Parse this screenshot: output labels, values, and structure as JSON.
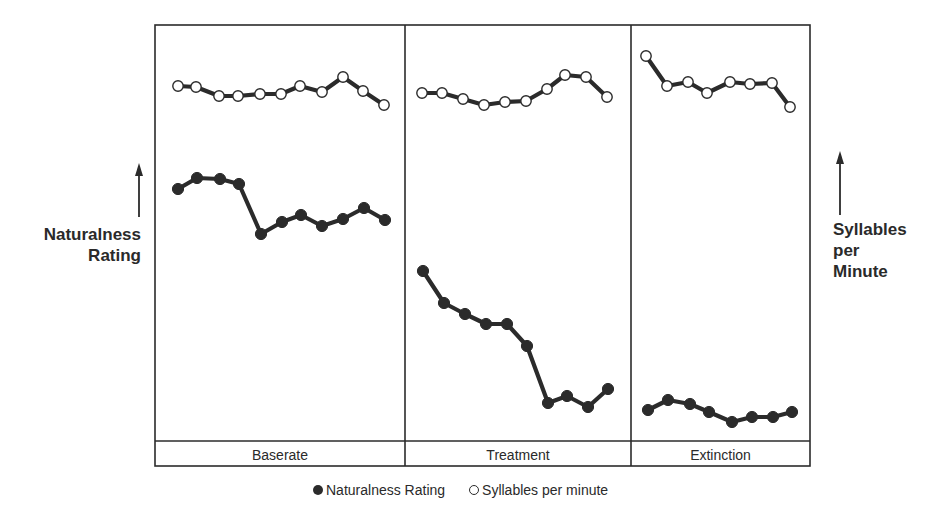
{
  "chart_data": {
    "type": "line",
    "title": "",
    "subtitle": "",
    "xlabel": "",
    "ylabel_left": "Naturalness Rating",
    "ylabel_right": "Syllables per Minute",
    "axis_note": "No numeric ticks shown; y values are relative (0 = bottom of plot area, 100 = top), estimated from pixel positions.",
    "ylim": [
      0,
      100
    ],
    "grid": false,
    "legend_position": "bottom-center",
    "phases": [
      {
        "name": "Baserate",
        "sessions": 11
      },
      {
        "name": "Treatment",
        "sessions": 10
      },
      {
        "name": "Extinction",
        "sessions": 8
      }
    ],
    "series": [
      {
        "name": "Naturalness Rating",
        "marker": "filled-circle",
        "color": "#2b2b2b",
        "phases": {
          "Baserate": [
            60.6,
            63.2,
            63.0,
            61.8,
            49.8,
            52.6,
            54.3,
            51.7,
            53.4,
            56.0,
            53.1
          ],
          "Treatment": [
            40.9,
            33.2,
            30.5,
            28.1,
            28.1,
            22.8,
            9.1,
            10.8,
            8.2,
            12.5
          ],
          "Extinction": [
            7.5,
            9.9,
            8.9,
            7.0,
            4.6,
            5.8,
            5.8,
            7.0
          ]
        }
      },
      {
        "name": "Syllables per minute",
        "marker": "open-circle",
        "color": "#2b2b2b",
        "phases": {
          "Baserate": [
            85.3,
            85.1,
            82.9,
            82.9,
            83.4,
            83.4,
            85.3,
            83.9,
            87.5,
            84.1,
            80.8
          ],
          "Treatment": [
            83.7,
            83.7,
            82.2,
            80.8,
            81.5,
            81.7,
            84.6,
            87.96,
            87.5,
            82.7
          ],
          "Extinction": [
            92.5,
            85.3,
            86.3,
            83.7,
            86.3,
            85.8,
            86.1,
            80.3
          ]
        }
      }
    ]
  },
  "labels": {
    "left_axis": [
      "Naturalness",
      "Rating"
    ],
    "right_axis": [
      "Syllables",
      "per",
      "Minute"
    ],
    "phases": [
      "Baserate",
      "Treatment",
      "Extinction"
    ],
    "legend": {
      "filled": "Naturalness Rating",
      "open": "Syllables per minute"
    }
  },
  "render": {
    "frame": {
      "x1": 155,
      "y1": 25,
      "x2": 810,
      "y2": 466,
      "label_band_top": 441
    },
    "dividers": [
      405,
      631
    ],
    "naturalness_points": [
      [
        178,
        189
      ],
      [
        197,
        178
      ],
      [
        220,
        179
      ],
      [
        239,
        184
      ],
      [
        261,
        234
      ],
      [
        282,
        222
      ],
      [
        301,
        215
      ],
      [
        322,
        226
      ],
      [
        343,
        219
      ],
      [
        364,
        208
      ],
      [
        385,
        220
      ],
      [
        423,
        271
      ],
      [
        444,
        303
      ],
      [
        465,
        314
      ],
      [
        486,
        324
      ],
      [
        507,
        324
      ],
      [
        527,
        346
      ],
      [
        548,
        403
      ],
      [
        567,
        396
      ],
      [
        588,
        407
      ],
      [
        608,
        389
      ],
      [
        648,
        410
      ],
      [
        668,
        400
      ],
      [
        690,
        404
      ],
      [
        709,
        412
      ],
      [
        732,
        422
      ],
      [
        752,
        417
      ],
      [
        773,
        417
      ],
      [
        792,
        412
      ]
    ],
    "naturalness_segments": [
      [
        0,
        11
      ],
      [
        11,
        21
      ],
      [
        21,
        29
      ]
    ],
    "syllables_points": [
      [
        178,
        86
      ],
      [
        196,
        87
      ],
      [
        219,
        96
      ],
      [
        238,
        96
      ],
      [
        260,
        94
      ],
      [
        281,
        94
      ],
      [
        300,
        86
      ],
      [
        322,
        92
      ],
      [
        343,
        77
      ],
      [
        363,
        91
      ],
      [
        384,
        105
      ],
      [
        422,
        93
      ],
      [
        442,
        93
      ],
      [
        463,
        99
      ],
      [
        484,
        105
      ],
      [
        505,
        102
      ],
      [
        526,
        101
      ],
      [
        547,
        89
      ],
      [
        565,
        75
      ],
      [
        586,
        77
      ],
      [
        607,
        97
      ],
      [
        646,
        56
      ],
      [
        667,
        86
      ],
      [
        688,
        82
      ],
      [
        707,
        93
      ],
      [
        730,
        82
      ],
      [
        750,
        84
      ],
      [
        772,
        83
      ],
      [
        790,
        107
      ]
    ],
    "syllables_segments": [
      [
        0,
        11
      ],
      [
        11,
        21
      ],
      [
        21,
        29
      ]
    ],
    "left_arrow": {
      "x": 139,
      "y_top": 163,
      "y_bottom": 217
    },
    "right_arrow": {
      "x": 840,
      "y_top": 151,
      "y_bottom": 215
    }
  }
}
